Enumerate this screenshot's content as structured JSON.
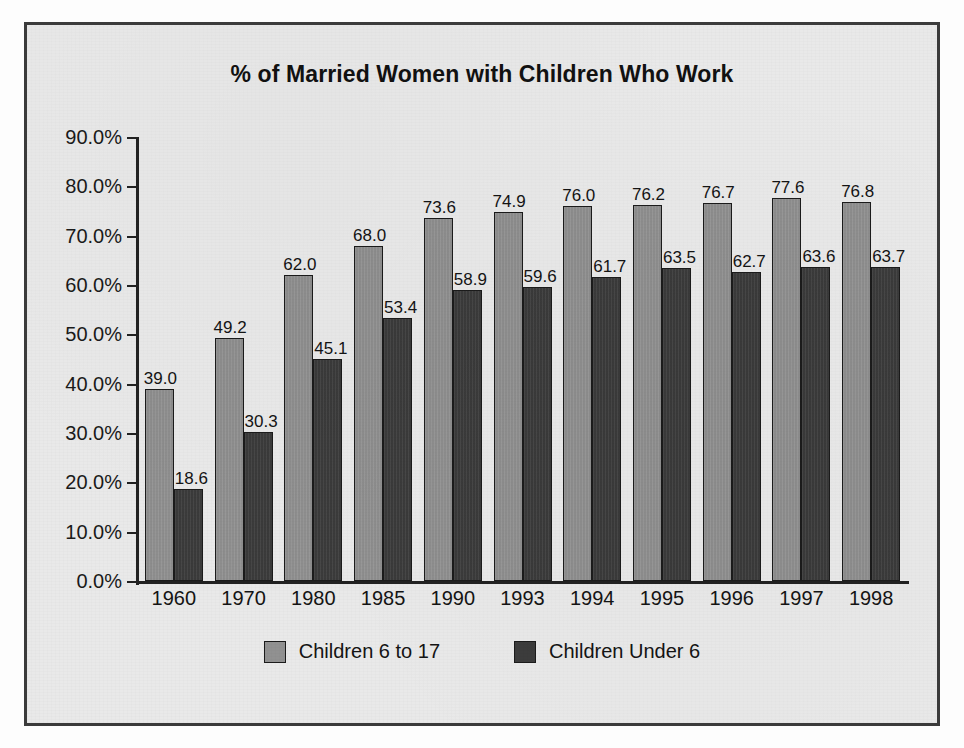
{
  "chart_data": {
    "type": "bar",
    "title": "% of Married Women with Children Who Work",
    "xlabel": "",
    "ylabel": "",
    "ylim": [
      0,
      90
    ],
    "grid": false,
    "legend_position": "bottom",
    "categories": [
      "1960",
      "1970",
      "1980",
      "1985",
      "1990",
      "1993",
      "1994",
      "1995",
      "1996",
      "1997",
      "1998"
    ],
    "ytick_labels": [
      "90.0%",
      "80.0%",
      "70.0%",
      "60.0%",
      "50.0%",
      "40.0%",
      "30.0%",
      "20.0%",
      "10.0%",
      "0.0%"
    ],
    "ytick_values": [
      90,
      80,
      70,
      60,
      50,
      40,
      30,
      20,
      10,
      0
    ],
    "series": [
      {
        "name": "Children 6 to 17",
        "color": "#919191",
        "values": [
          39.0,
          49.2,
          62.0,
          68.0,
          73.6,
          74.9,
          76.0,
          76.2,
          76.7,
          77.6,
          76.8
        ],
        "labels": [
          "39.0",
          "49.2",
          "62.0",
          "68.0",
          "73.6",
          "74.9",
          "76.0",
          "76.2",
          "76.7",
          "77.6",
          "76.8"
        ]
      },
      {
        "name": "Children Under 6",
        "color": "#3c3c3c",
        "values": [
          18.6,
          30.3,
          45.1,
          53.4,
          58.9,
          59.6,
          61.7,
          63.5,
          62.7,
          63.6,
          63.7
        ],
        "labels": [
          "18.6",
          "30.3",
          "45.1",
          "53.4",
          "58.9",
          "59.6",
          "61.7",
          "63.5",
          "62.7",
          "63.6",
          "63.7"
        ]
      }
    ]
  },
  "legend": [
    {
      "label": "Children 6 to 17",
      "color": "#919191"
    },
    {
      "label": "Children Under 6",
      "color": "#3c3c3c"
    }
  ],
  "colors": {
    "series_light": "#919191",
    "series_dark": "#3c3c3c",
    "plot_background": "#e9e9e9",
    "frame_border": "#3b3b3b",
    "axis": "#222222",
    "text": "#141414"
  }
}
